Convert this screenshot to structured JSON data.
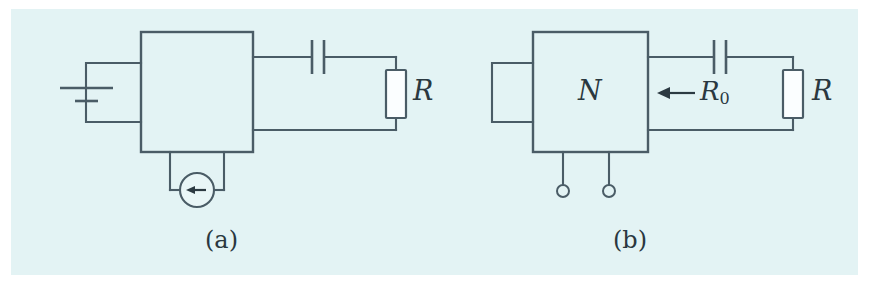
{
  "figure": {
    "type": "circuit-diagram",
    "background_color": "#e3f3f4",
    "line_color": "#4a5c66",
    "text_color": "#2a3840",
    "panels": [
      {
        "id": "a",
        "caption": "(a)",
        "box_label": "",
        "components": [
          {
            "name": "battery",
            "symbol": "long-short-plates",
            "position": "left-stub"
          },
          {
            "name": "capacitor",
            "symbol": "two-equal-plates",
            "position": "top-right-branch"
          },
          {
            "name": "resistor",
            "symbol": "rectangle",
            "label": "R",
            "position": "right-branch"
          },
          {
            "name": "current-source",
            "symbol": "circle-with-left-arrow",
            "position": "bottom-stub"
          }
        ]
      },
      {
        "id": "b",
        "caption": "(b)",
        "box_label": "N",
        "components": [
          {
            "name": "open-stub",
            "symbol": "rectangle",
            "position": "left-stub"
          },
          {
            "name": "capacitor",
            "symbol": "two-equal-plates",
            "position": "top-right-branch"
          },
          {
            "name": "resistor",
            "symbol": "rectangle",
            "label": "R",
            "position": "right-branch"
          },
          {
            "name": "input-resistance-arrow",
            "symbol": "left-arrow",
            "label": "R0",
            "position": "right-port"
          },
          {
            "name": "terminal-pair",
            "symbol": "open-circles",
            "count": 2,
            "position": "bottom"
          }
        ]
      }
    ]
  },
  "labels": {
    "resistor_a": "R",
    "resistor_b": "R",
    "network_box": "N",
    "input_resistance": "R",
    "input_resistance_sub": "0",
    "caption_a": "(a)",
    "caption_b": "(b)"
  }
}
